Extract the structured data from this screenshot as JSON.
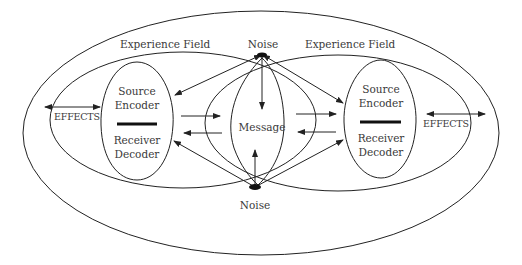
{
  "diagram": {
    "type": "communication-model",
    "noise_top": "Noise",
    "noise_bottom": "Noise",
    "left_field": {
      "label": "Experience Field",
      "effects": "EFFECTS",
      "encoder": {
        "line1": "Source",
        "line2": "Encoder"
      },
      "decoder": {
        "line1": "Receiver",
        "line2": "Decoder"
      }
    },
    "right_field": {
      "label": "Experience Field",
      "effects": "EFFECTS",
      "encoder": {
        "line1": "Source",
        "line2": "Encoder"
      },
      "decoder": {
        "line1": "Receiver",
        "line2": "Decoder"
      }
    },
    "message": "Message",
    "colors": {
      "stroke": "#222222",
      "text": "#3a3a3a",
      "background": "#ffffff"
    }
  }
}
